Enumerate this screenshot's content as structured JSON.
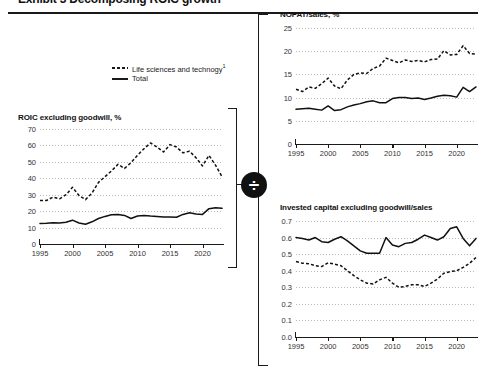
{
  "exhibit": {
    "title_clipped": "Exhibit 3 Decomposing ROIC growth",
    "divide_symbol": "÷"
  },
  "legend": {
    "items": [
      {
        "label": "Life sciences and technogy",
        "footnote": "1",
        "style": "dashed"
      },
      {
        "label": "Total",
        "footnote": "",
        "style": "solid"
      }
    ]
  },
  "chart_data": [
    {
      "id": "roic",
      "type": "line",
      "title": "ROIC excluding goodwill, %",
      "xlabel": "",
      "ylabel": "",
      "xlim": [
        1995,
        2023
      ],
      "ylim": [
        0,
        70
      ],
      "yticks": [
        "0",
        "10",
        "20",
        "30",
        "40",
        "50",
        "60",
        "70"
      ],
      "xticks": [
        "1995",
        "2000",
        "2005",
        "2010",
        "2015",
        "2020"
      ],
      "grid": true,
      "legend_position": "above-left",
      "x": [
        1995,
        1996,
        1997,
        1998,
        1999,
        2000,
        2001,
        2002,
        2003,
        2004,
        2005,
        2006,
        2007,
        2008,
        2009,
        2010,
        2011,
        2012,
        2013,
        2014,
        2015,
        2016,
        2017,
        2018,
        2019,
        2020,
        2021,
        2022,
        2023
      ],
      "series": [
        {
          "name": "Life sciences and technogy",
          "style": "dashed",
          "values": [
            26.5,
            26.5,
            28.5,
            27.5,
            30.0,
            34.5,
            29.5,
            27.0,
            31.0,
            37.5,
            41.0,
            44.5,
            48.5,
            46.0,
            49.5,
            54.0,
            58.0,
            61.5,
            59.0,
            56.0,
            60.5,
            59.0,
            55.5,
            56.5,
            52.5,
            47.5,
            54.0,
            48.0,
            41.0
          ]
        },
        {
          "name": "Total",
          "style": "solid",
          "values": [
            12.5,
            12.7,
            13.0,
            12.8,
            13.2,
            14.5,
            12.8,
            12.0,
            13.5,
            15.5,
            16.8,
            17.8,
            18.0,
            17.4,
            15.5,
            17.0,
            17.3,
            17.0,
            16.8,
            16.5,
            16.5,
            16.3,
            18.0,
            19.0,
            18.3,
            18.0,
            21.5,
            22.0,
            21.7
          ]
        }
      ]
    },
    {
      "id": "nopat_sales",
      "type": "line",
      "title": "NOPAT/sales, %",
      "xlabel": "",
      "ylabel": "",
      "xlim": [
        1995,
        2023
      ],
      "ylim": [
        0,
        25
      ],
      "yticks": [
        "0",
        "5",
        "10",
        "15",
        "20",
        "25"
      ],
      "xticks": [
        "1995",
        "2000",
        "2005",
        "2010",
        "2015",
        "2020"
      ],
      "grid": true,
      "x": [
        1995,
        1996,
        1997,
        1998,
        1999,
        2000,
        2001,
        2002,
        2003,
        2004,
        2005,
        2006,
        2007,
        2008,
        2009,
        2010,
        2011,
        2012,
        2013,
        2014,
        2015,
        2016,
        2017,
        2018,
        2019,
        2020,
        2021,
        2022,
        2023
      ],
      "series": [
        {
          "name": "Life sciences and technogy",
          "style": "dashed",
          "values": [
            11.8,
            11.3,
            12.3,
            12.0,
            13.0,
            14.2,
            12.5,
            11.9,
            13.8,
            15.0,
            15.3,
            15.2,
            16.3,
            16.8,
            18.5,
            18.0,
            17.5,
            18.1,
            17.8,
            18.0,
            17.7,
            18.2,
            18.3,
            20.1,
            19.2,
            19.3,
            21.2,
            19.5,
            19.4
          ]
        },
        {
          "name": "Total",
          "style": "solid",
          "values": [
            7.5,
            7.6,
            7.7,
            7.5,
            7.3,
            8.2,
            7.2,
            7.4,
            8.0,
            8.4,
            8.7,
            9.1,
            9.3,
            8.9,
            8.9,
            9.8,
            10.0,
            10.0,
            9.8,
            9.9,
            9.6,
            9.9,
            10.3,
            10.5,
            10.4,
            10.1,
            12.2,
            11.3,
            12.3
          ]
        }
      ]
    },
    {
      "id": "invested_capital_sales",
      "type": "line",
      "title": "Invested capital excluding goodwill/sales",
      "xlabel": "",
      "ylabel": "",
      "xlim": [
        1995,
        2023
      ],
      "ylim": [
        0.0,
        0.7
      ],
      "yticks": [
        "0.0",
        "0.1",
        "0.2",
        "0.3",
        "0.4",
        "0.5",
        "0.6",
        "0.7"
      ],
      "xticks": [
        "1995",
        "2000",
        "2005",
        "2010",
        "2015",
        "2020"
      ],
      "grid": true,
      "x": [
        1995,
        1996,
        1997,
        1998,
        1999,
        2000,
        2001,
        2002,
        2003,
        2004,
        2005,
        2006,
        2007,
        2008,
        2009,
        2010,
        2011,
        2012,
        2013,
        2014,
        2015,
        2016,
        2017,
        2018,
        2019,
        2020,
        2021,
        2022,
        2023
      ],
      "series": [
        {
          "name": "Total",
          "style": "solid",
          "values": [
            0.6,
            0.595,
            0.585,
            0.6,
            0.575,
            0.57,
            0.59,
            0.605,
            0.58,
            0.55,
            0.52,
            0.505,
            0.505,
            0.505,
            0.6,
            0.555,
            0.545,
            0.565,
            0.57,
            0.59,
            0.615,
            0.6,
            0.585,
            0.605,
            0.655,
            0.665,
            0.595,
            0.55,
            0.595
          ]
        },
        {
          "name": "Life sciences and technogy",
          "style": "dashed",
          "values": [
            0.455,
            0.445,
            0.442,
            0.43,
            0.425,
            0.448,
            0.44,
            0.43,
            0.4,
            0.37,
            0.345,
            0.325,
            0.32,
            0.345,
            0.36,
            0.325,
            0.3,
            0.305,
            0.315,
            0.315,
            0.305,
            0.325,
            0.35,
            0.385,
            0.395,
            0.4,
            0.42,
            0.445,
            0.48
          ]
        }
      ]
    }
  ]
}
